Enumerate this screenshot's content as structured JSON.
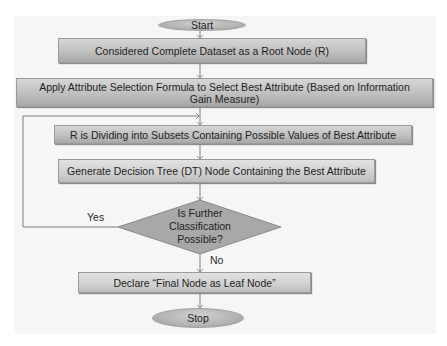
{
  "flowchart": {
    "start": "Start",
    "step1": "Considered Complete Dataset as a Root Node (R)",
    "step2": "Apply Attribute Selection Formula to Select Best Attribute (Based on Information Gain Measure)",
    "step3": "R is Dividing into Subsets Containing Possible Values of Best Attribute",
    "step4": "Generate  Decision Tree (DT) Node Containing the Best Attribute",
    "decision": {
      "line1": "Is Further",
      "line2": "Classification",
      "line3": "Possible?"
    },
    "yes_label": "Yes",
    "no_label": "No",
    "step5": "Declare “Final Node as Leaf Node”",
    "stop": "Stop"
  },
  "colors": {
    "node_fill": "#bfbfbf",
    "diamond_fill": "#a6a6a6",
    "line": "#6e6e6e",
    "background": "#f6f6f6"
  }
}
